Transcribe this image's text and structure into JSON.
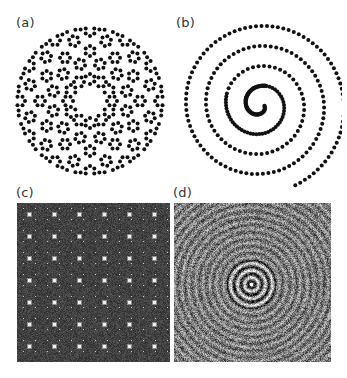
{
  "figure": {
    "panels": [
      {
        "id": "a",
        "label": "(a)",
        "description": "Point pattern with 12-fold rotational symmetry arranged in hexagonal/dodecagonal clusters",
        "kind": "quasiperiodic-points",
        "symmetry": 12,
        "dot_color": "#111111"
      },
      {
        "id": "b",
        "label": "(b)",
        "description": "Points arranged along an Archimedean spiral with increasing spacing outward",
        "kind": "spiral-points",
        "turns": 4,
        "dot_color": "#111111"
      },
      {
        "id": "c",
        "label": "(c)",
        "description": "Grayscale periodic lattice diffraction-like pattern with bright spots",
        "kind": "periodic-diffraction-image",
        "background_color": "#3a3a3a",
        "spot_color": "#f0f0f0"
      },
      {
        "id": "d",
        "label": "(d)",
        "description": "Grayscale concentric ring interference pattern with bright center",
        "kind": "concentric-ring-image",
        "background_color": "#4a4a4a",
        "ring_color": "#e0e0e0"
      }
    ]
  }
}
